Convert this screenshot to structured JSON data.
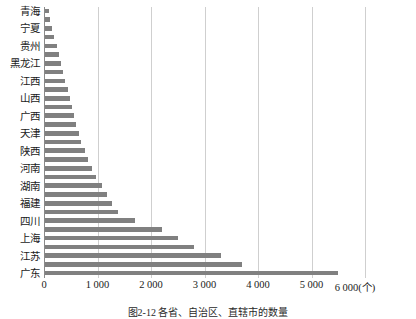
{
  "chart_data": {
    "type": "bar",
    "orientation": "horizontal",
    "title": "",
    "subtitle": "",
    "xlabel": "(个)",
    "ylabel": "",
    "xlim": [
      0,
      6000
    ],
    "xticks": [
      0,
      1000,
      2000,
      3000,
      4000,
      5000,
      6000
    ],
    "xticklabels": [
      "0",
      "1 000",
      "2 000",
      "3 000",
      "4 000",
      "5 000",
      "6 000"
    ],
    "unit_suffix": "(个)",
    "grid": "vertical",
    "legend": null,
    "bar_color": "#808080",
    "categories": [
      "青海",
      "西藏",
      "宁夏",
      "海南",
      "贵州",
      "甘肃",
      "黑龙江",
      "吉林",
      "江西",
      "内蒙古",
      "山西",
      "新疆",
      "广西",
      "云南",
      "天津",
      "重庆",
      "陕西",
      "河北",
      "河南",
      "辽宁",
      "湖南",
      "湖北",
      "福建",
      "安徽",
      "四川",
      "山东",
      "上海",
      "浙江",
      "江苏",
      "北京",
      "广东"
    ],
    "values": [
      90,
      110,
      150,
      190,
      240,
      280,
      320,
      360,
      400,
      440,
      480,
      520,
      560,
      600,
      650,
      700,
      760,
      820,
      900,
      980,
      1080,
      1180,
      1280,
      1380,
      1700,
      2200,
      2500,
      2800,
      3300,
      3700,
      5500
    ],
    "visible_category_labels": [
      "青海",
      "宁夏",
      "贵州",
      "黑龙江",
      "江西",
      "山西",
      "广西",
      "天津",
      "陕西",
      "河南",
      "湖南",
      "福建",
      "四川",
      "上海",
      "江苏",
      "广东"
    ]
  },
  "caption": "图2-12 各省、自治区、直辖市的数量"
}
